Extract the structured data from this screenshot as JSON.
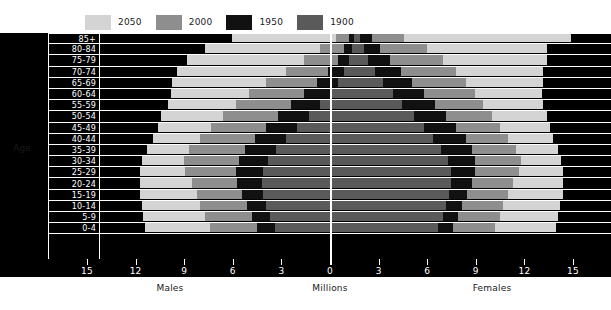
{
  "chart_data": {
    "type": "bar",
    "subtype": "population-pyramid",
    "title": "",
    "xlabel": "Millions",
    "ylabel": "Age",
    "left_label": "Males",
    "right_label": "Females",
    "grid": false,
    "legend_position": "top-left",
    "xlim": [
      0,
      15
    ],
    "xticks": [
      15,
      12,
      9,
      6,
      3,
      0,
      3,
      6,
      9,
      12,
      15
    ],
    "xticks_left": [
      "15",
      "12",
      "9",
      "6",
      "3",
      "0"
    ],
    "xticks_right": [
      "0",
      "3",
      "6",
      "9",
      "12",
      "15"
    ],
    "categories": [
      "85+",
      "80-84",
      "75-79",
      "70-74",
      "65-69",
      "60-64",
      "55-59",
      "50-54",
      "45-49",
      "40-44",
      "35-39",
      "30-34",
      "25-29",
      "20-24",
      "15-19",
      "10-14",
      "5-9",
      "0-4"
    ],
    "series_order": [
      "2050",
      "2000",
      "1950",
      "1900"
    ],
    "series": [
      {
        "name": "2050",
        "color": "#d4d4d4",
        "males": [
          7.6,
          9.3,
          10.4,
          11.0,
          11.3,
          11.4,
          11.6,
          12.0,
          12.2,
          12.5,
          12.9,
          13.2,
          13.3,
          13.3,
          13.3,
          13.2,
          13.1,
          13.0
        ],
        "females": [
          13.3,
          11.8,
          11.8,
          11.6,
          11.6,
          11.5,
          11.6,
          11.8,
          12.0,
          12.2,
          12.5,
          12.7,
          12.8,
          12.8,
          12.8,
          12.6,
          12.5,
          12.4
        ]
      },
      {
        "name": "2000",
        "color": "#8e8e8e",
        "males": [
          1.2,
          2.2,
          3.2,
          4.3,
          5.5,
          6.6,
          7.4,
          8.2,
          8.9,
          9.6,
          10.3,
          10.6,
          10.5,
          10.1,
          9.8,
          9.6,
          9.3,
          9.0
        ],
        "females": [
          3.0,
          4.4,
          5.4,
          6.2,
          6.8,
          7.4,
          7.9,
          8.4,
          8.9,
          9.4,
          9.9,
          10.2,
          10.1,
          9.7,
          9.4,
          9.1,
          8.9,
          8.6
        ]
      },
      {
        "name": "1950",
        "color": "#111111",
        "males": [
          0.4,
          0.7,
          1.1,
          1.7,
          2.4,
          3.2,
          4.0,
          4.8,
          5.5,
          6.2,
          6.8,
          7.2,
          7.4,
          7.3,
          7.0,
          6.7,
          6.4,
          6.1
        ],
        "females": [
          1.0,
          1.5,
          2.1,
          2.8,
          3.5,
          4.2,
          4.9,
          5.6,
          6.2,
          6.8,
          7.2,
          7.4,
          7.4,
          7.2,
          6.9,
          6.6,
          6.3,
          6.0
        ]
      },
      {
        "name": "1900",
        "color": "#5a5a5a",
        "males": [
          0.1,
          0.2,
          0.4,
          0.7,
          1.1,
          1.6,
          2.2,
          2.9,
          3.6,
          4.3,
          4.9,
          5.4,
          5.7,
          5.8,
          5.7,
          5.5,
          5.3,
          5.0
        ],
        "females": [
          0.3,
          0.5,
          0.8,
          1.2,
          1.7,
          2.3,
          2.9,
          3.6,
          4.2,
          4.8,
          5.3,
          5.7,
          5.9,
          5.9,
          5.8,
          5.6,
          5.4,
          5.1
        ]
      }
    ]
  },
  "legend": {
    "items": [
      {
        "label": "2050",
        "color": "#d4d4d4"
      },
      {
        "label": "2000",
        "color": "#8e8e8e"
      },
      {
        "label": "1950",
        "color": "#111111"
      },
      {
        "label": "1900",
        "color": "#5a5a5a"
      }
    ]
  },
  "axes": {
    "y_axis_title": "Age",
    "x_axis_center_label": "Millions",
    "x_axis_left_label": "Males",
    "x_axis_right_label": "Females"
  }
}
